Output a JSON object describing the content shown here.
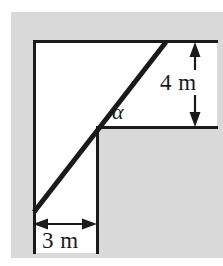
{
  "figure": {
    "type": "geometry-diagram",
    "background_color": "#ffffff",
    "shaded_color": "#d9d9d9",
    "line_color": "#1a1a1a"
  },
  "labels": {
    "vertical_dimension": "4 m",
    "horizontal_dimension": "3 m",
    "angle": "α"
  },
  "geometry": {
    "shaded_region": {
      "x": 11,
      "y": 12,
      "width": 212,
      "height": 246
    },
    "white_region": {
      "x": 33,
      "y": 41,
      "width": 184,
      "height": 212
    },
    "lines": {
      "top_horizontal": {
        "x1": 33,
        "y1": 41,
        "x2": 217,
        "y2": 41
      },
      "left_vertical": {
        "x1": 33,
        "y1": 41,
        "x2": 33,
        "y2": 253
      },
      "step_vertical": {
        "x1": 97,
        "y1": 127,
        "x2": 97,
        "y2": 253
      },
      "step_horizontal": {
        "x1": 97,
        "y1": 127,
        "x2": 217,
        "y2": 127
      },
      "diagonal": {
        "x1": 34,
        "y1": 212,
        "x2": 166,
        "y2": 42
      }
    },
    "dimension_arrows": {
      "vertical": {
        "x": 195,
        "y1": 44,
        "y2": 125
      },
      "horizontal": {
        "y": 224,
        "x1": 34,
        "x2": 96
      }
    }
  }
}
